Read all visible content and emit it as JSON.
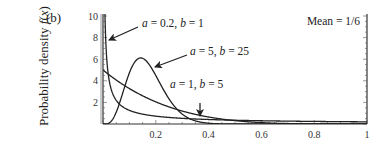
{
  "panel_label": "(b)",
  "chart_data": {
    "type": "line",
    "title": "",
    "xlabel": "",
    "ylabel": "Probability density f(x)",
    "xlim": [
      0,
      1
    ],
    "ylim": [
      0,
      10
    ],
    "x_ticks": [
      "0.2",
      "0.4",
      "0.6",
      "0.8",
      "1"
    ],
    "y_ticks": [
      "2",
      "4",
      "6",
      "8",
      "10"
    ],
    "grid": false,
    "legend": null,
    "annotations": [
      {
        "text": "a = 0.2, b = 1",
        "points_to": "spike near x=0, y≈8"
      },
      {
        "text": "a = 5, b = 25",
        "points_to": "peak near x≈0.16, y≈6"
      },
      {
        "text": "a = 1, b = 5",
        "points_to": "curve near x≈0.37, y≈0.5"
      },
      {
        "text": "Mean = 1/6"
      }
    ],
    "series": [
      {
        "name": "a = 0.2, b = 1",
        "distribution": "Beta(0.2, 1)",
        "x": [
          0.002,
          0.005,
          0.01,
          0.02,
          0.05,
          0.1,
          0.2,
          0.4,
          0.6,
          0.8,
          1.0
        ],
        "y": [
          28.8,
          13.8,
          7.96,
          4.57,
          2.2,
          1.26,
          0.72,
          0.42,
          0.3,
          0.24,
          0.2
        ]
      },
      {
        "name": "a = 5, b = 25",
        "distribution": "Beta(5, 25)",
        "x": [
          0,
          0.05,
          0.1,
          0.14,
          0.16,
          0.2,
          0.25,
          0.3,
          0.35,
          0.4,
          0.5
        ],
        "y": [
          0,
          1.5,
          5.0,
          6.0,
          5.9,
          4.8,
          2.8,
          1.3,
          0.5,
          0.17,
          0.01
        ]
      },
      {
        "name": "a = 1, b = 5",
        "distribution": "Beta(1, 5)",
        "x": [
          0,
          0.1,
          0.2,
          0.3,
          0.4,
          0.5,
          0.6,
          0.8,
          1.0
        ],
        "y": [
          5.0,
          3.28,
          2.05,
          1.2,
          0.65,
          0.31,
          0.13,
          0.008,
          0
        ]
      }
    ]
  },
  "labels": {
    "ann1": "a = 0.2, b = 1",
    "ann2": "a = 5, b = 25",
    "ann3": "a = 1, b = 5",
    "mean": "Mean = 1/6",
    "ylabel": "Probability density f(x)"
  }
}
